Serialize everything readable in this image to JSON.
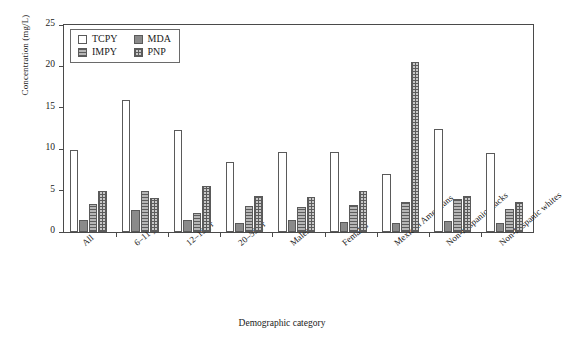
{
  "chart_data": {
    "type": "bar",
    "title": "",
    "xlabel": "Demographic category",
    "ylabel": "Concentration (mg/L)",
    "ylim": [
      0,
      25
    ],
    "yticks": [
      0,
      5,
      10,
      15,
      20,
      25
    ],
    "grid": false,
    "legend_position": "top-left",
    "categories": [
      "All",
      "6–11 yr",
      "12–19 yr",
      "20–59 yr",
      "Males",
      "Females",
      "Mexican Americans",
      "Non-Hispanic blacks",
      "Non-Hispanic whites"
    ],
    "series": [
      {
        "name": "TCPY",
        "color": "#ffffff",
        "pattern": "solid-white",
        "values": [
          9.9,
          15.9,
          12.3,
          8.4,
          9.7,
          9.7,
          7.0,
          12.4,
          9.6
        ]
      },
      {
        "name": "MDA",
        "color": "#8a8a8a",
        "pattern": "solid-gray",
        "values": [
          1.5,
          2.7,
          1.5,
          1.1,
          1.4,
          1.2,
          1.1,
          1.3,
          1.1
        ]
      },
      {
        "name": "IMPY",
        "color": "#b6b6b6",
        "pattern": "horizontal-lines",
        "values": [
          3.4,
          5.0,
          2.3,
          3.1,
          3.0,
          3.3,
          3.6,
          4.0,
          2.8
        ]
      },
      {
        "name": "PNP",
        "color": "#c9c9c9",
        "pattern": "crosshatch",
        "values": [
          5.0,
          4.1,
          5.6,
          4.3,
          4.2,
          4.9,
          20.5,
          4.4,
          3.6
        ]
      }
    ]
  },
  "legend": {
    "entries": [
      {
        "label": "TCPY"
      },
      {
        "label": "MDA"
      },
      {
        "label": "IMPY"
      },
      {
        "label": "PNP"
      }
    ]
  }
}
